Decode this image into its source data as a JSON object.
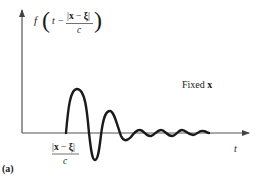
{
  "figure": {
    "panel_label": "(a)",
    "y_axis_label": {
      "function": "f",
      "open_paren": "(",
      "t": "t",
      "minus": "−",
      "numerator": "|x − ξ|",
      "numerator_parts": {
        "bar_left": "|",
        "x": "x",
        "minus": " − ",
        "xi": "ξ",
        "bar_right": "|"
      },
      "denominator": "c",
      "close_paren": ")"
    },
    "x_axis_label": "t",
    "delay_marker": {
      "numerator": "|x − ξ|",
      "numerator_parts": {
        "bar_left": "|",
        "x": "x",
        "minus": " − ",
        "xi": "ξ",
        "bar_right": "|"
      },
      "denominator": "c"
    },
    "annotation": {
      "text": "Fixed",
      "bold_symbol": "x"
    },
    "colors": {
      "axis": "#555555",
      "curve": "#1a1a1a",
      "text": "#1a1a1a",
      "background": "#ffffff"
    },
    "geometry": {
      "origin": [
        22,
        133
      ],
      "y_axis_top": 8,
      "x_axis_right": 251,
      "signal_start_x": 66
    },
    "waveform_description": "Damped oscillation starting at delay |x−ξ|/c: large positive lobe, deep negative lobe, smaller positive lobe, then small decaying ripples along the time axis"
  }
}
